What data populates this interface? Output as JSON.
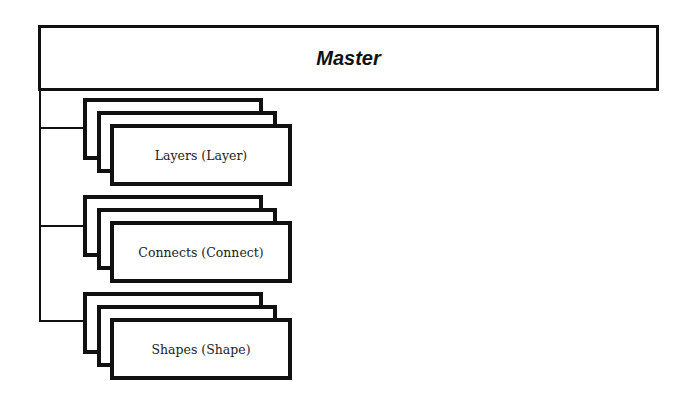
{
  "diagram": {
    "root": {
      "label": "Master"
    },
    "children": [
      {
        "label": "Layers (Layer)",
        "top": 98
      },
      {
        "label": "Connects (Connect)",
        "top": 195
      },
      {
        "label": "Shapes (Shape)",
        "top": 292
      }
    ]
  }
}
